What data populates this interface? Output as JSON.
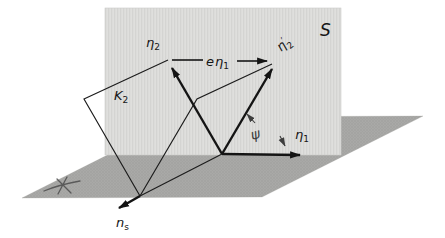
{
  "figure": {
    "labels": {
      "s_plane": "S",
      "eta2": {
        "main": "η",
        "sub": "2"
      },
      "e_eta1": {
        "coeff": "e",
        "main": "η",
        "sub": "1"
      },
      "eta2_prime": {
        "main": "η",
        "prime": "′",
        "sub": "2"
      },
      "k2": {
        "main": "K",
        "sub": "2"
      },
      "psi": "ψ",
      "eta1": {
        "main": "η",
        "sub": "1"
      },
      "n_s": {
        "main": "n",
        "sub": "s"
      }
    },
    "colors": {
      "background": "#ffffff",
      "s_plane_fill": "#dfdfdd",
      "s_plane_stripe": "#d4d4d2",
      "ground_fill": "#a9a9a7",
      "ground_stipple": "#9c9c9a",
      "line": "#1c1c1c",
      "pencil": "#3d3d3d"
    },
    "icons": {
      "arrowhead": "filled-triangle-arrowhead",
      "ground_mark": "handwritten-cross-scribble"
    }
  }
}
